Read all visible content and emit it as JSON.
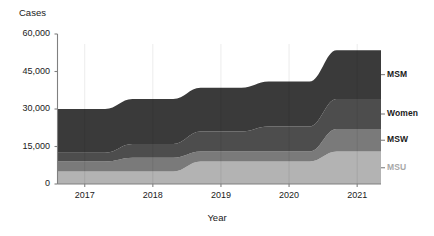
{
  "chart_data": {
    "type": "area",
    "title": "",
    "subtitle": "",
    "xlabel": "Year",
    "ylabel": "Cases",
    "stacked": true,
    "grid": false,
    "legend_position": "right",
    "categories": [
      "2017",
      "2018",
      "2019",
      "2020",
      "2021"
    ],
    "x": [
      2017,
      2018,
      2019,
      2020,
      2021
    ],
    "xlim": [
      2016.6,
      2021.35
    ],
    "ylim": [
      0,
      60000
    ],
    "yticks": [
      0,
      15000,
      30000,
      45000,
      60000
    ],
    "ytick_labels": [
      "0",
      "15,000",
      "30,000",
      "45,000",
      "60,000"
    ],
    "xtick_labels": [
      "2017",
      "2018",
      "2019",
      "2020",
      "2021"
    ],
    "stack_order_bottom_to_top": [
      "MSU",
      "MSW",
      "Women",
      "MSM"
    ],
    "series": [
      {
        "name": "MSU",
        "label": "MSU",
        "color": "#b3b3b3",
        "values": [
          5000,
          5000,
          9000,
          9000,
          13000
        ]
      },
      {
        "name": "MSW",
        "label": "MSW",
        "color": "#7a7a7a",
        "values": [
          4000,
          5500,
          4000,
          4000,
          9000
        ]
      },
      {
        "name": "Women",
        "label": "Women",
        "color": "#4d4d4d",
        "values": [
          3500,
          5500,
          8000,
          10000,
          12000
        ]
      },
      {
        "name": "MSM",
        "label": "MSM",
        "color": "#3a3a3a",
        "values": [
          17500,
          18000,
          17500,
          18000,
          19500
        ]
      }
    ],
    "totals": [
      30000,
      34000,
      38500,
      41000,
      53500
    ],
    "cumulative_tops": {
      "MSU": [
        5000,
        5000,
        9000,
        9000,
        13000
      ],
      "MSW": [
        9000,
        10500,
        13000,
        13000,
        22000
      ],
      "Women": [
        12500,
        16000,
        21000,
        23000,
        34000
      ],
      "MSM": [
        30000,
        34000,
        38500,
        41000,
        53500
      ]
    }
  },
  "axes": {
    "y_title": "Cases",
    "x_title": "Year"
  },
  "colors": {
    "msu": "#b3b3b3",
    "msw": "#7a7a7a",
    "women": "#4d4d4d",
    "msm": "#3a3a3a",
    "axis": "#808080",
    "text": "#1a1a1a",
    "msu_label": "#a8a8a8",
    "background": "#ffffff"
  }
}
